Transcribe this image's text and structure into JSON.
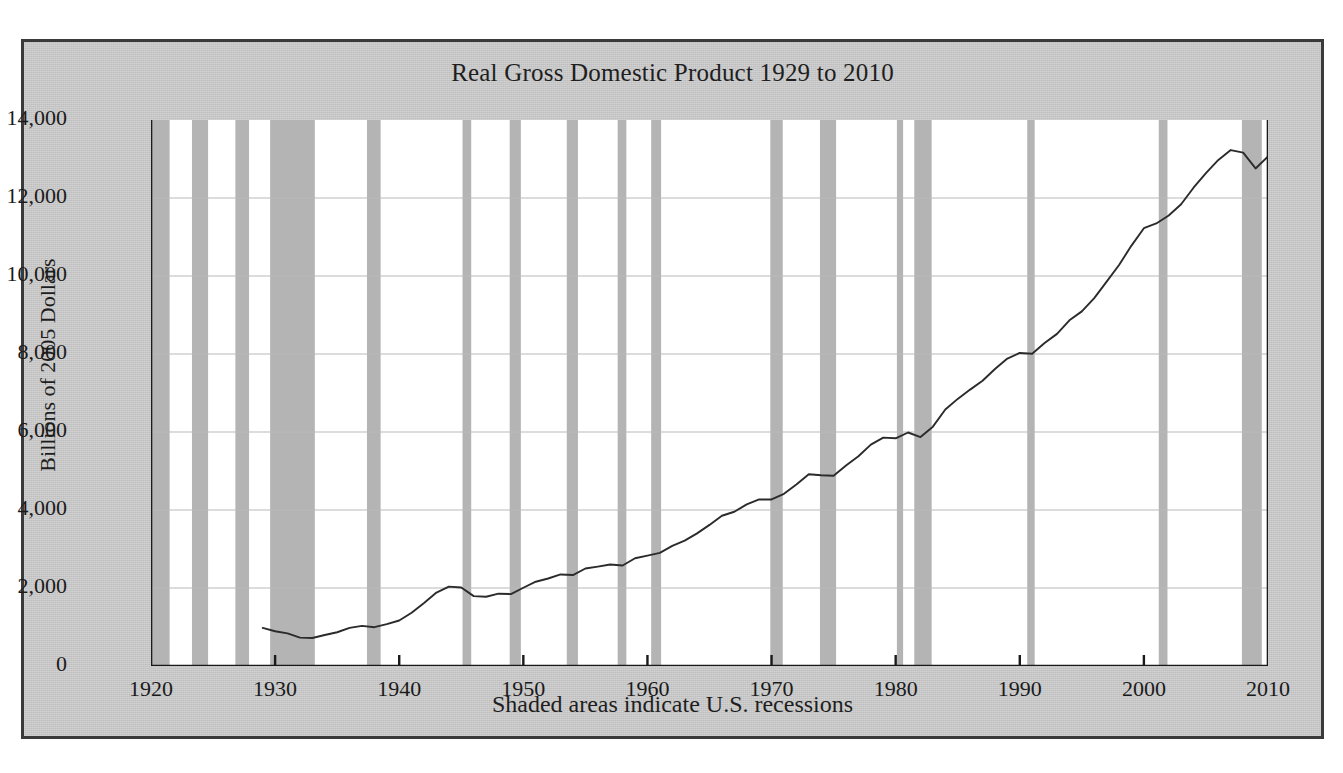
{
  "figure": {
    "title": "Real Gross Domestic Product 1929 to 2010",
    "ylabel": "Billions of 2005 Dollars",
    "caption": "Shaded areas indicate U.S. recessions",
    "frame_color": "#3a3a3a",
    "background_color": "#c8c8c8",
    "plot_background_color": "#ffffff",
    "recession_band_color": "#b4b4b4",
    "line_color": "#2b2b2b",
    "gridline_color": "#b9b9b9"
  },
  "chart_data": {
    "type": "line",
    "title": "Real Gross Domestic Product 1929 to 2010",
    "xlabel": "Shaded areas indicate U.S. recessions",
    "ylabel": "Billions of 2005 Dollars",
    "xlim": [
      1920,
      2010
    ],
    "ylim": [
      0,
      14000
    ],
    "xticks": [
      1920,
      1930,
      1940,
      1950,
      1960,
      1970,
      1980,
      1990,
      2000,
      2010
    ],
    "xtick_labels": [
      "1920",
      "1930",
      "1940",
      "1950",
      "1960",
      "1970",
      "1980",
      "1990",
      "2000",
      "2010"
    ],
    "yticks": [
      0,
      2000,
      4000,
      6000,
      8000,
      10000,
      12000,
      14000
    ],
    "ytick_labels": [
      "0",
      "2,000",
      "4,000",
      "6,000",
      "8,000",
      "10,000",
      "12,000",
      "14,000"
    ],
    "grid": true,
    "grid_axis": "y",
    "legend": null,
    "series": [
      {
        "name": "Real GDP",
        "x": [
          1929,
          1930,
          1931,
          1932,
          1933,
          1934,
          1935,
          1936,
          1937,
          1938,
          1939,
          1940,
          1941,
          1942,
          1943,
          1944,
          1945,
          1946,
          1947,
          1948,
          1949,
          1950,
          1951,
          1952,
          1953,
          1954,
          1955,
          1956,
          1957,
          1958,
          1959,
          1960,
          1961,
          1962,
          1963,
          1964,
          1965,
          1966,
          1967,
          1968,
          1969,
          1970,
          1971,
          1972,
          1973,
          1974,
          1975,
          1976,
          1977,
          1978,
          1979,
          1980,
          1981,
          1982,
          1983,
          1984,
          1985,
          1986,
          1987,
          1988,
          1989,
          1990,
          1991,
          1992,
          1993,
          1994,
          1995,
          1996,
          1997,
          1998,
          1999,
          2000,
          2001,
          2002,
          2003,
          2004,
          2005,
          2006,
          2007,
          2008,
          2009,
          2010
        ],
        "y": [
          977,
          892,
          835,
          727,
          717,
          795,
          866,
          979,
          1030,
          995,
          1073,
          1166,
          1366,
          1618,
          1883,
          2035,
          2012,
          1792,
          1776,
          1854,
          1844,
          2006,
          2161,
          2244,
          2347,
          2332,
          2500,
          2549,
          2601,
          2578,
          2762,
          2830,
          2900,
          3080,
          3215,
          3400,
          3618,
          3853,
          3955,
          4143,
          4270,
          4270,
          4414,
          4654,
          4918,
          4891,
          4880,
          5140,
          5377,
          5677,
          5855,
          5839,
          5987,
          5871,
          6137,
          6577,
          6849,
          7087,
          7313,
          7614,
          7884,
          8027,
          8008,
          8280,
          8516,
          8864,
          9093,
          9434,
          9854,
          10283,
          10780,
          11226,
          11348,
          11553,
          11841,
          12264,
          12638,
          12976,
          13229,
          13162,
          12758,
          13063
        ],
        "y_unit": "billions of chained 2005 dollars"
      }
    ],
    "recessions": [
      {
        "start": 1920.0,
        "end": 1921.5
      },
      {
        "start": 1923.3,
        "end": 1924.6
      },
      {
        "start": 1926.8,
        "end": 1927.9
      },
      {
        "start": 1929.6,
        "end": 1933.2
      },
      {
        "start": 1937.4,
        "end": 1938.5
      },
      {
        "start": 1945.1,
        "end": 1945.8
      },
      {
        "start": 1948.9,
        "end": 1949.8
      },
      {
        "start": 1953.5,
        "end": 1954.4
      },
      {
        "start": 1957.6,
        "end": 1958.3
      },
      {
        "start": 1960.3,
        "end": 1961.1
      },
      {
        "start": 1969.9,
        "end": 1970.9
      },
      {
        "start": 1973.9,
        "end": 1975.2
      },
      {
        "start": 1980.1,
        "end": 1980.6
      },
      {
        "start": 1981.5,
        "end": 1982.9
      },
      {
        "start": 1990.6,
        "end": 1991.2
      },
      {
        "start": 2001.2,
        "end": 2001.9
      },
      {
        "start": 2007.9,
        "end": 2009.5
      }
    ]
  }
}
